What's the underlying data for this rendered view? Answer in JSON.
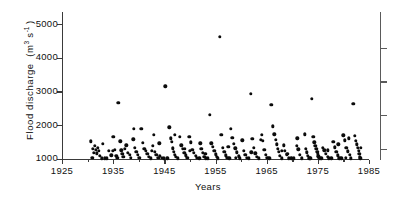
{
  "chart_data": {
    "type": "scatter",
    "title": "",
    "xlabel": "Years",
    "ylabel": "Flood discharge (m3 s-1)",
    "ylabel_parts": {
      "text": "Flood discharge  (m",
      "sup1": "3",
      "mid": " s",
      "sup2": "-1",
      "close": " )"
    },
    "xlim": [
      1925,
      1985
    ],
    "ylim": [
      1000,
      5200
    ],
    "grid": false,
    "legend": null,
    "xticks": [
      1925,
      1935,
      1945,
      1955,
      1965,
      1975,
      1985
    ],
    "xticks_minor": [
      1930,
      1940,
      1950,
      1960,
      1970,
      1980
    ],
    "yticks": [
      1000,
      2000,
      3000,
      4000,
      5000
    ],
    "ytick_labels": [
      "1000",
      "2000",
      "3000",
      "4000",
      "5000"
    ],
    "marker": "filled-circle",
    "marker_color": "#0b0b0b",
    "n_points": 198,
    "points": [
      [
        1930.6,
        1520
      ],
      [
        1931.0,
        1290
      ],
      [
        1931.2,
        1180
      ],
      [
        1931.4,
        1390
      ],
      [
        1931.6,
        1260
      ],
      [
        1931.8,
        1160
      ],
      [
        1932.0,
        1330
      ],
      [
        1932.2,
        1230
      ],
      [
        1932.4,
        1080
      ],
      [
        1932.8,
        1010
      ],
      [
        1933.4,
        1010
      ],
      [
        1933.8,
        1010
      ],
      [
        1934.2,
        1240
      ],
      [
        1934.6,
        1100
      ],
      [
        1935.0,
        1640
      ],
      [
        1935.3,
        1260
      ],
      [
        1935.6,
        1080
      ],
      [
        1936.0,
        2660
      ],
      [
        1936.4,
        1510
      ],
      [
        1936.6,
        1250
      ],
      [
        1936.8,
        1150
      ],
      [
        1937.0,
        1060
      ],
      [
        1937.3,
        1300
      ],
      [
        1937.6,
        1400
      ],
      [
        1937.9,
        1170
      ],
      [
        1938.2,
        1120
      ],
      [
        1938.5,
        1030
      ],
      [
        1938.9,
        1580
      ],
      [
        1939.2,
        1330
      ],
      [
        1939.5,
        1210
      ],
      [
        1939.8,
        1110
      ],
      [
        1940.1,
        1020
      ],
      [
        1940.5,
        1880
      ],
      [
        1940.8,
        1470
      ],
      [
        1941.1,
        1300
      ],
      [
        1941.4,
        1240
      ],
      [
        1941.7,
        1150
      ],
      [
        1942.0,
        1060
      ],
      [
        1942.4,
        1010
      ],
      [
        1942.8,
        1380
      ],
      [
        1943.1,
        1210
      ],
      [
        1943.4,
        1120
      ],
      [
        1943.8,
        1020
      ],
      [
        1944.1,
        1080
      ],
      [
        1944.5,
        1020
      ],
      [
        1944.9,
        1010
      ],
      [
        1945.2,
        3150
      ],
      [
        1945.6,
        1010
      ],
      [
        1946.0,
        1930
      ],
      [
        1946.3,
        1600
      ],
      [
        1946.5,
        1500
      ],
      [
        1946.7,
        1310
      ],
      [
        1946.9,
        1210
      ],
      [
        1947.1,
        1120
      ],
      [
        1947.3,
        1050
      ],
      [
        1947.6,
        1010
      ],
      [
        1948.0,
        1650
      ],
      [
        1948.3,
        1400
      ],
      [
        1948.6,
        1290
      ],
      [
        1948.9,
        1180
      ],
      [
        1949.2,
        1100
      ],
      [
        1949.5,
        1020
      ],
      [
        1949.9,
        1640
      ],
      [
        1950.2,
        1490
      ],
      [
        1950.5,
        1260
      ],
      [
        1950.8,
        1170
      ],
      [
        1951.1,
        1080
      ],
      [
        1951.4,
        1020
      ],
      [
        1951.8,
        1010
      ],
      [
        1952.2,
        1300
      ],
      [
        1952.5,
        1180
      ],
      [
        1952.8,
        1060
      ],
      [
        1953.1,
        1010
      ],
      [
        1953.5,
        1010
      ],
      [
        1953.9,
        2300
      ],
      [
        1954.2,
        1460
      ],
      [
        1954.5,
        1350
      ],
      [
        1954.8,
        1240
      ],
      [
        1955.0,
        1130
      ],
      [
        1955.2,
        1050
      ],
      [
        1955.5,
        1010
      ],
      [
        1955.8,
        4620
      ],
      [
        1956.1,
        1700
      ],
      [
        1956.4,
        1330
      ],
      [
        1956.7,
        1200
      ],
      [
        1957.0,
        1100
      ],
      [
        1957.3,
        1020
      ],
      [
        1957.7,
        1010
      ],
      [
        1958.0,
        1880
      ],
      [
        1958.3,
        1620
      ],
      [
        1958.6,
        1440
      ],
      [
        1958.9,
        1310
      ],
      [
        1959.2,
        1190
      ],
      [
        1959.5,
        1070
      ],
      [
        1959.8,
        1010
      ],
      [
        1960.2,
        1540
      ],
      [
        1960.5,
        1240
      ],
      [
        1960.8,
        1120
      ],
      [
        1961.1,
        1030
      ],
      [
        1961.5,
        1010
      ],
      [
        1961.9,
        2930
      ],
      [
        1962.2,
        1590
      ],
      [
        1962.5,
        1320
      ],
      [
        1962.8,
        1160
      ],
      [
        1963.1,
        1050
      ],
      [
        1963.5,
        1010
      ],
      [
        1963.9,
        1560
      ],
      [
        1964.2,
        1530
      ],
      [
        1964.5,
        1260
      ],
      [
        1964.8,
        1120
      ],
      [
        1965.1,
        1020
      ],
      [
        1965.5,
        1010
      ],
      [
        1965.9,
        2600
      ],
      [
        1966.2,
        1960
      ],
      [
        1966.5,
        1720
      ],
      [
        1966.8,
        1560
      ],
      [
        1967.0,
        1420
      ],
      [
        1967.2,
        1300
      ],
      [
        1967.4,
        1200
      ],
      [
        1967.6,
        1090
      ],
      [
        1967.9,
        1010
      ],
      [
        1968.3,
        1400
      ],
      [
        1968.6,
        1230
      ],
      [
        1968.9,
        1110
      ],
      [
        1969.3,
        1010
      ],
      [
        1969.8,
        1010
      ],
      [
        1970.3,
        1010
      ],
      [
        1970.9,
        1390
      ],
      [
        1971.2,
        1280
      ],
      [
        1971.5,
        1120
      ],
      [
        1971.9,
        1010
      ],
      [
        1972.4,
        1720
      ],
      [
        1972.6,
        1290
      ],
      [
        1972.8,
        1190
      ],
      [
        1973.0,
        1080
      ],
      [
        1973.3,
        1010
      ],
      [
        1973.8,
        2780
      ],
      [
        1974.1,
        1640
      ],
      [
        1974.3,
        1480
      ],
      [
        1974.5,
        1380
      ],
      [
        1974.7,
        1300
      ],
      [
        1974.9,
        1210
      ],
      [
        1975.0,
        1140
      ],
      [
        1975.1,
        1070
      ],
      [
        1975.2,
        1020
      ],
      [
        1975.4,
        1010
      ],
      [
        1975.7,
        1010
      ],
      [
        1976.0,
        1330
      ],
      [
        1976.3,
        1250
      ],
      [
        1976.6,
        1150
      ],
      [
        1976.9,
        1060
      ],
      [
        1977.2,
        1010
      ],
      [
        1977.6,
        1010
      ],
      [
        1978.0,
        1500
      ],
      [
        1978.3,
        1340
      ],
      [
        1978.6,
        1210
      ],
      [
        1978.9,
        1100
      ],
      [
        1979.2,
        1010
      ],
      [
        1979.6,
        1010
      ],
      [
        1980.0,
        1690
      ],
      [
        1980.3,
        1540
      ],
      [
        1980.6,
        1330
      ],
      [
        1980.9,
        1220
      ],
      [
        1981.2,
        1110
      ],
      [
        1981.5,
        1010
      ],
      [
        1981.9,
        2630
      ],
      [
        1982.2,
        1680
      ],
      [
        1982.4,
        1530
      ],
      [
        1982.6,
        1420
      ],
      [
        1982.8,
        1330
      ],
      [
        1983.0,
        1230
      ],
      [
        1983.1,
        1140
      ],
      [
        1983.2,
        1060
      ],
      [
        1983.3,
        1010
      ],
      [
        1930.9,
        1030
      ],
      [
        1933.0,
        1440
      ],
      [
        1934.9,
        1230
      ],
      [
        1939.0,
        1880
      ],
      [
        1943.0,
        1700
      ],
      [
        1944.0,
        1460
      ],
      [
        1947.0,
        1700
      ],
      [
        1950.0,
        1240
      ],
      [
        1953.0,
        1150
      ],
      [
        1957.5,
        1350
      ],
      [
        1962.0,
        1190
      ],
      [
        1964.0,
        1700
      ],
      [
        1968.0,
        1230
      ],
      [
        1971.0,
        1600
      ],
      [
        1977.0,
        1250
      ],
      [
        1979.0,
        1420
      ],
      [
        1981.0,
        1600
      ],
      [
        1983.4,
        1320
      ],
      [
        1935.8,
        1020
      ],
      [
        1942.6,
        1230
      ],
      [
        1949.0,
        1300
      ],
      [
        1952.0,
        1450
      ],
      [
        1959.0,
        1030
      ],
      [
        1969.0,
        1150
      ],
      [
        1973.5,
        1010
      ],
      [
        1980.5,
        1030
      ]
    ]
  }
}
